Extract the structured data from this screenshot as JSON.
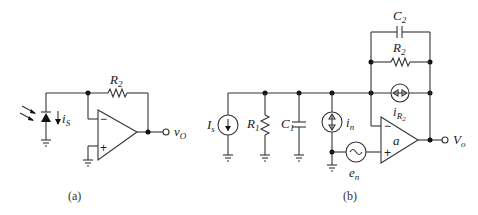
{
  "figure": {
    "panel_a": {
      "caption": "(a)",
      "components": {
        "photodiode_current": "i",
        "photodiode_current_sub": "S",
        "feedback_resistor": "R",
        "feedback_resistor_sub": "2",
        "output": "v",
        "output_sub": "O",
        "inverting_input": "−",
        "noninverting_input": "+"
      }
    },
    "panel_b": {
      "caption": "(b)",
      "components": {
        "signal_source": "I",
        "signal_source_sub": "s",
        "input_resistor": "R",
        "input_resistor_sub": "1",
        "input_capacitor": "C",
        "input_capacitor_sub": "1",
        "current_noise": "i",
        "current_noise_sub": "n",
        "voltage_noise": "e",
        "voltage_noise_sub": "n",
        "feedback_capacitor": "C",
        "feedback_capacitor_sub": "2",
        "feedback_resistor": "R",
        "feedback_resistor_sub": "2",
        "resistor_noise": "i",
        "resistor_noise_sub": "R",
        "resistor_noise_sub2": "2",
        "opamp_gain": "a",
        "output": "V",
        "output_sub": "o",
        "inverting_input": "−",
        "noninverting_input": "+"
      }
    }
  }
}
